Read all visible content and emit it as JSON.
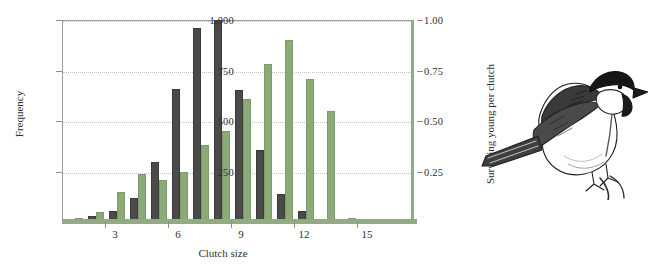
{
  "figure": {
    "organism": "great-tit",
    "colors": {
      "frequency_bar": "#4a4a48",
      "survival_bar": "#8caa77",
      "axis_green": "#93ab84",
      "gridline": "#c3c3c3",
      "text": "#2f2f2f"
    }
  },
  "chart_data": {
    "type": "bar",
    "title": "",
    "xlabel": "Clutch size",
    "ylabel": "Frequency",
    "y2label": "Surviving young per clutch",
    "categories": [
      1,
      2,
      3,
      4,
      5,
      6,
      7,
      8,
      9,
      10,
      11,
      12,
      13,
      14
    ],
    "x_tick_labels": [
      "3",
      "6",
      "9",
      "12",
      "15"
    ],
    "x_tick_values": [
      3,
      6,
      9,
      12,
      15
    ],
    "ylim": [
      0,
      1000
    ],
    "y_tick_labels": [
      "250",
      "500",
      "750",
      "1,000"
    ],
    "y_tick_values": [
      250,
      500,
      750,
      1000
    ],
    "y2lim": [
      0,
      1.0
    ],
    "y2_tick_labels": [
      "0.25",
      "0.50",
      "0.75",
      "1.00"
    ],
    "y2_tick_values": [
      0.25,
      0.5,
      0.75,
      1.0
    ],
    "grid": true,
    "legend": "none",
    "series": [
      {
        "name": "Frequency",
        "axis": "left",
        "color": "#4a4a48",
        "values": [
          10,
          30,
          55,
          120,
          295,
          660,
          960,
          1000,
          655,
          355,
          140,
          55,
          15,
          5
        ]
      },
      {
        "name": "Surviving young per clutch",
        "axis": "right",
        "color": "#8caa77",
        "values": [
          0.02,
          0.05,
          0.15,
          0.24,
          0.21,
          0.25,
          0.38,
          0.45,
          0.61,
          0.78,
          0.9,
          0.71,
          0.55,
          0.02
        ]
      }
    ]
  },
  "illustration": {
    "name": "great-tit-bird-drawing",
    "alt": "Ink drawing of a great tit perched on a twig"
  }
}
